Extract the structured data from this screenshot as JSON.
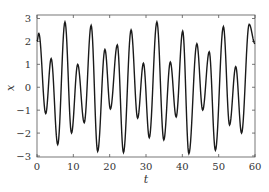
{
  "chart_data": {
    "type": "line",
    "title": "",
    "xlabel": "t",
    "ylabel": "x",
    "xlim": [
      0,
      60
    ],
    "ylim": [
      -3.1,
      3.1
    ],
    "grid": false,
    "legend": null,
    "xticks": [
      0,
      10,
      20,
      30,
      40,
      50,
      60
    ],
    "yticks": [
      -3,
      -2,
      -1,
      0,
      1,
      2,
      3
    ],
    "line_color": "#1a1a1a",
    "series": [
      {
        "name": "x(t)",
        "extrema": {
          "t": [
            0,
            0.5,
            2.4,
            3.9,
            5.7,
            7.7,
            9.5,
            11.2,
            13.0,
            14.9,
            16.7,
            18.7,
            20.2,
            22.1,
            23.8,
            25.9,
            27.7,
            29.3,
            30.9,
            33.0,
            34.9,
            36.7,
            38.3,
            40.1,
            41.8,
            44.0,
            45.6,
            47.4,
            49.1,
            51.3,
            53.0,
            54.7,
            56.3,
            58.4,
            60
          ],
          "x": [
            2.0,
            2.35,
            -1.15,
            1.25,
            -2.5,
            2.85,
            -2.0,
            1.0,
            -1.55,
            2.7,
            -2.8,
            1.65,
            -0.95,
            1.85,
            -2.85,
            2.5,
            -1.35,
            1.05,
            -2.2,
            2.85,
            -2.3,
            1.1,
            -1.3,
            2.45,
            -2.9,
            1.9,
            -1.0,
            1.55,
            -2.75,
            2.65,
            -1.65,
            0.9,
            -2.0,
            2.75,
            1.9
          ]
        }
      }
    ]
  }
}
